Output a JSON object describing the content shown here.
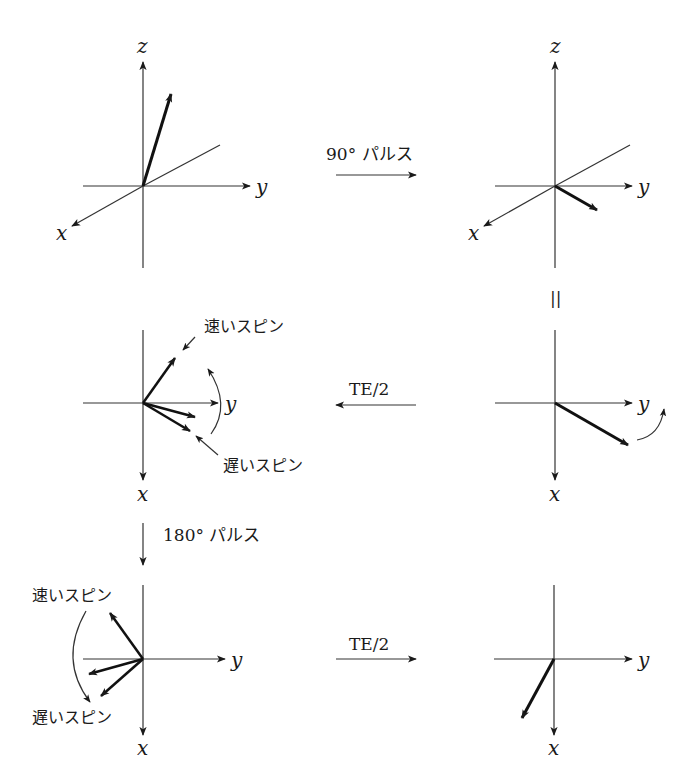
{
  "figure": {
    "steps": {
      "pulse_90": "90° パルス",
      "te_half_1": "TE/2",
      "pulse_180": "180° パルス",
      "te_half_2": "TE/2",
      "equals": "||"
    },
    "spin_labels": {
      "fast": "速いスピン",
      "slow": "遅いスピン"
    },
    "axes": {
      "x": "x",
      "y": "y",
      "z": "z"
    },
    "panels": [
      {
        "id": "initial-3d",
        "description": "Magnetization vector tilted near +z in 3D axes (x, y, z)"
      },
      {
        "id": "after-90-3d",
        "description": "Vector tipped into xy-plane after 90° pulse"
      },
      {
        "id": "xy-top-right",
        "description": "Top view of xy-plane with vector and rotation arrow"
      },
      {
        "id": "dephasing",
        "description": "Fast and slow spins fanning out after TE/2"
      },
      {
        "id": "after-180",
        "description": "Spins flipped after 180° pulse"
      },
      {
        "id": "rephased",
        "description": "Spins refocused into single vector after TE/2"
      }
    ]
  }
}
